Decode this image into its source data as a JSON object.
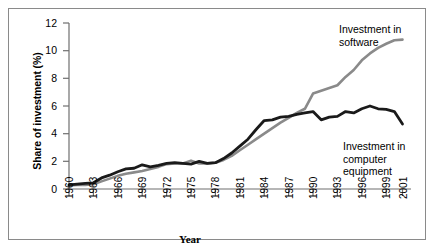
{
  "chart_data": {
    "type": "line",
    "title": "",
    "xlabel": "Year",
    "ylabel": "Share of investment (%)",
    "xlim": [
      1960,
      2001
    ],
    "ylim": [
      0,
      12
    ],
    "ytick_labels": [
      "0",
      "2",
      "4",
      "6",
      "8",
      "10",
      "12"
    ],
    "ytick_values": [
      0,
      2,
      4,
      6,
      8,
      10,
      12
    ],
    "xtick_labels": [
      "1960",
      "1963",
      "1966",
      "1969",
      "1972",
      "1975",
      "1978",
      "1981",
      "1984",
      "1987",
      "1990",
      "1993",
      "1996",
      "1999",
      "2001"
    ],
    "xtick_values": [
      1960,
      1963,
      1966,
      1969,
      1972,
      1975,
      1978,
      1981,
      1984,
      1987,
      1990,
      1993,
      1996,
      1999,
      2001
    ],
    "grid": false,
    "legend_position": "inline-annotations",
    "x": [
      1960,
      1961,
      1962,
      1963,
      1964,
      1965,
      1966,
      1967,
      1968,
      1969,
      1970,
      1971,
      1972,
      1973,
      1974,
      1975,
      1976,
      1977,
      1978,
      1979,
      1980,
      1981,
      1982,
      1983,
      1984,
      1985,
      1986,
      1987,
      1988,
      1989,
      1990,
      1991,
      1992,
      1993,
      1994,
      1995,
      1996,
      1997,
      1998,
      1999,
      2000,
      2001
    ],
    "series": [
      {
        "name": "Investment in computer equipment",
        "color": "#1a1a1a",
        "values": [
          0.3,
          0.35,
          0.4,
          0.45,
          0.8,
          1.0,
          1.25,
          1.45,
          1.5,
          1.75,
          1.6,
          1.7,
          1.85,
          1.9,
          1.85,
          1.8,
          2.0,
          1.85,
          1.9,
          2.2,
          2.6,
          3.1,
          3.6,
          4.3,
          4.95,
          5.0,
          5.2,
          5.25,
          5.4,
          5.5,
          5.6,
          5.0,
          5.2,
          5.25,
          5.6,
          5.5,
          5.8,
          6.0,
          5.8,
          5.75,
          5.6,
          4.7
        ]
      },
      {
        "name": "Investment in software",
        "color": "#8a8a8a",
        "values": [
          0.25,
          0.3,
          0.3,
          0.35,
          0.55,
          0.75,
          0.95,
          1.1,
          1.2,
          1.3,
          1.45,
          1.6,
          1.8,
          1.85,
          1.85,
          2.05,
          1.85,
          1.85,
          1.9,
          2.1,
          2.4,
          2.8,
          3.2,
          3.6,
          4.0,
          4.4,
          4.8,
          5.15,
          5.5,
          5.8,
          6.9,
          7.1,
          7.3,
          7.5,
          8.1,
          8.6,
          9.3,
          9.8,
          10.2,
          10.5,
          10.75,
          10.8
        ]
      }
    ],
    "annotations": [
      {
        "id": "software",
        "text": "Investment in\nsoftware"
      },
      {
        "id": "equipment",
        "text": "Investment in\ncomputer\nequipment"
      }
    ]
  }
}
